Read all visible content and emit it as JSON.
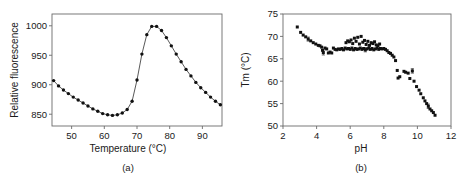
{
  "figure": {
    "background_color": "#ffffff",
    "marker_color": "#111111",
    "axis_color": "#6b6b6b"
  },
  "chart_data": [
    {
      "type": "line",
      "panel": "a",
      "caption": "(a)",
      "title": "",
      "xlabel": "Temperature (°C)",
      "ylabel": "Relative fluorescence",
      "xlim": [
        44,
        96
      ],
      "ylim": [
        830,
        1020
      ],
      "xticks": [
        50,
        60,
        70,
        80,
        90
      ],
      "yticks": [
        850,
        900,
        950,
        1000
      ],
      "grid": false,
      "legend": "none",
      "markers": true,
      "x": [
        44.5,
        46,
        47.5,
        49,
        50.5,
        52,
        53.5,
        55,
        56.5,
        58,
        59.5,
        61,
        62.5,
        64,
        65.5,
        67,
        68.5,
        70,
        71.5,
        73,
        74.5,
        76,
        77.5,
        79,
        80.5,
        82,
        83.5,
        85,
        86.5,
        88,
        89.5,
        91,
        92.5,
        94,
        95.5
      ],
      "values": [
        907,
        898,
        891,
        885,
        879,
        874,
        869,
        864,
        859,
        855,
        851,
        849,
        848,
        849,
        852,
        858,
        872,
        908,
        952,
        985,
        999,
        999,
        992,
        980,
        966,
        952,
        939,
        926,
        915,
        904,
        895,
        887,
        879,
        872,
        866
      ]
    },
    {
      "type": "scatter",
      "panel": "b",
      "caption": "(b)",
      "title": "",
      "xlabel": "pH",
      "ylabel": "Tm (°C)",
      "xlim": [
        2,
        12
      ],
      "ylim": [
        50,
        75
      ],
      "xticks": [
        2,
        4,
        6,
        8,
        10,
        12
      ],
      "yticks": [
        50,
        55,
        60,
        65,
        70,
        75
      ],
      "grid": false,
      "legend": "none",
      "errorbars": true,
      "points": [
        [
          2.85,
          72.1,
          0
        ],
        [
          3.05,
          70.9,
          0
        ],
        [
          3.2,
          70.3,
          0
        ],
        [
          3.35,
          69.9,
          0
        ],
        [
          3.5,
          69.4,
          0.9
        ],
        [
          3.65,
          69.0,
          0
        ],
        [
          3.8,
          68.6,
          0
        ],
        [
          3.95,
          68.3,
          0
        ],
        [
          4.1,
          68.0,
          0
        ],
        [
          4.2,
          67.9,
          0
        ],
        [
          4.3,
          67.6,
          0
        ],
        [
          4.35,
          66.9,
          0
        ],
        [
          4.4,
          66.4,
          1.1
        ],
        [
          4.5,
          67.4,
          0
        ],
        [
          4.6,
          67.2,
          0
        ],
        [
          4.7,
          66.3,
          0
        ],
        [
          4.8,
          66.5,
          0
        ],
        [
          4.9,
          66.3,
          0
        ],
        [
          5.0,
          67.4,
          0
        ],
        [
          5.1,
          67.1,
          0
        ],
        [
          5.2,
          67.0,
          0
        ],
        [
          5.3,
          67.2,
          0
        ],
        [
          5.4,
          67.1,
          0
        ],
        [
          5.5,
          67.3,
          0
        ],
        [
          5.6,
          67.0,
          0
        ],
        [
          5.7,
          67.4,
          0
        ],
        [
          5.75,
          68.6,
          0
        ],
        [
          5.8,
          67.2,
          0
        ],
        [
          5.85,
          69.0,
          0
        ],
        [
          5.9,
          67.3,
          0
        ],
        [
          5.95,
          68.8,
          0
        ],
        [
          6.0,
          67.1,
          0
        ],
        [
          6.05,
          69.2,
          0
        ],
        [
          6.1,
          67.4,
          0
        ],
        [
          6.15,
          68.4,
          0
        ],
        [
          6.2,
          67.0,
          0
        ],
        [
          6.25,
          69.6,
          0
        ],
        [
          6.3,
          67.3,
          0
        ],
        [
          6.35,
          68.9,
          0
        ],
        [
          6.4,
          67.1,
          0
        ],
        [
          6.45,
          69.8,
          0
        ],
        [
          6.5,
          67.2,
          0
        ],
        [
          6.55,
          68.3,
          0
        ],
        [
          6.6,
          67.4,
          0
        ],
        [
          6.65,
          70.0,
          0
        ],
        [
          6.7,
          67.1,
          0
        ],
        [
          6.75,
          68.7,
          0
        ],
        [
          6.8,
          67.3,
          0
        ],
        [
          6.85,
          69.1,
          0
        ],
        [
          6.9,
          67.0,
          0.9
        ],
        [
          6.95,
          68.2,
          0
        ],
        [
          7.0,
          67.2,
          0
        ],
        [
          7.05,
          68.9,
          0
        ],
        [
          7.1,
          67.4,
          0
        ],
        [
          7.15,
          68.0,
          0
        ],
        [
          7.2,
          67.1,
          0
        ],
        [
          7.25,
          68.6,
          0
        ],
        [
          7.3,
          67.3,
          0
        ],
        [
          7.35,
          68.4,
          0
        ],
        [
          7.4,
          67.0,
          0
        ],
        [
          7.45,
          68.8,
          0
        ],
        [
          7.5,
          67.2,
          0
        ],
        [
          7.55,
          68.1,
          0
        ],
        [
          7.6,
          67.4,
          0
        ],
        [
          7.65,
          67.9,
          0
        ],
        [
          7.7,
          67.1,
          0
        ],
        [
          7.75,
          68.3,
          0
        ],
        [
          7.8,
          67.3,
          0
        ],
        [
          7.9,
          67.2,
          0
        ],
        [
          8.0,
          67.3,
          0
        ],
        [
          8.1,
          67.1,
          0
        ],
        [
          8.2,
          66.8,
          0
        ],
        [
          8.3,
          66.4,
          0
        ],
        [
          8.4,
          66.2,
          0
        ],
        [
          8.5,
          65.8,
          0
        ],
        [
          8.6,
          65.4,
          0
        ],
        [
          8.7,
          64.6,
          0
        ],
        [
          8.8,
          62.4,
          0
        ],
        [
          8.85,
          60.7,
          0
        ],
        [
          8.95,
          61.0,
          0
        ],
        [
          9.2,
          62.2,
          0
        ],
        [
          9.3,
          62.0,
          0
        ],
        [
          9.45,
          61.8,
          0
        ],
        [
          9.55,
          60.6,
          0
        ],
        [
          9.7,
          62.3,
          1.0
        ],
        [
          9.8,
          60.0,
          0
        ],
        [
          9.95,
          58.8,
          0
        ],
        [
          10.1,
          58.0,
          0
        ],
        [
          10.2,
          57.2,
          0
        ],
        [
          10.35,
          56.3,
          0
        ],
        [
          10.45,
          55.6,
          0
        ],
        [
          10.55,
          55.0,
          0
        ],
        [
          10.65,
          54.4,
          1.0
        ],
        [
          10.75,
          53.8,
          0
        ],
        [
          10.85,
          53.4,
          0
        ],
        [
          10.95,
          53.0,
          0
        ],
        [
          11.05,
          52.4,
          0
        ]
      ]
    }
  ]
}
